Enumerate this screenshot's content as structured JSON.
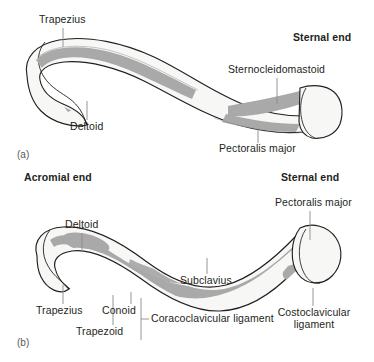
{
  "figure": {
    "panels": [
      {
        "tag": "(a)",
        "view": "superior surface of right clavicle",
        "ends": [
          {
            "name": "sternal-end",
            "label": "Sternal end"
          }
        ],
        "labels": [
          {
            "name": "trapezius",
            "text": "Trapezius"
          },
          {
            "name": "deltoid",
            "text": "Deltoid"
          },
          {
            "name": "sternocleidomastoid",
            "text": "Sternocleidomastoid"
          },
          {
            "name": "pectoralis-major",
            "text": "Pectoralis major"
          }
        ]
      },
      {
        "tag": "(b)",
        "view": "inferior surface of right clavicle",
        "ends": [
          {
            "name": "acromial-end",
            "label": "Acromial end"
          },
          {
            "name": "sternal-end",
            "label": "Sternal end"
          }
        ],
        "labels": [
          {
            "name": "deltoid",
            "text": "Deltoid"
          },
          {
            "name": "pectoralis-major",
            "text": "Pectoralis major"
          },
          {
            "name": "trapezius",
            "text": "Trapezius"
          },
          {
            "name": "conoid",
            "text": "Conoid"
          },
          {
            "name": "trapezoid",
            "text": "Trapezoid"
          },
          {
            "name": "coracoclavicular-ligament",
            "text": "Coracoclavicular ligament"
          },
          {
            "name": "subclavius",
            "text": "Subclavius"
          },
          {
            "name": "costoclavicular-ligament-line1",
            "text": "Costoclavicular"
          },
          {
            "name": "costoclavicular-ligament-line2",
            "text": "ligament"
          }
        ]
      }
    ]
  },
  "colors": {
    "background": "#ffffff",
    "bone_fill": "#f7f7f5",
    "bone_fill_shade": "#eeeeec",
    "attachment_gray": "#a9a9a9",
    "attachment_gray_light": "#c0c0c0",
    "outline": "#231f20",
    "leader_line": "#8a8a8a",
    "text": "#231f20",
    "tag_text": "#58585a"
  }
}
